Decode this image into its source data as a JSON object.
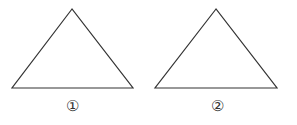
{
  "figures": [
    {
      "id": "triangle-1",
      "label": "①",
      "points": [
        [
          72,
          9
        ],
        [
          12,
          88
        ],
        [
          133,
          88
        ]
      ],
      "label_pos": [
        72,
        99
      ]
    },
    {
      "id": "triangle-2",
      "label": "②",
      "points": [
        [
          216,
          9
        ],
        [
          155,
          88
        ],
        [
          277,
          88
        ]
      ],
      "label_pos": [
        217,
        99
      ]
    }
  ],
  "colors": {
    "stroke": "#333333",
    "background": "#ffffff"
  }
}
